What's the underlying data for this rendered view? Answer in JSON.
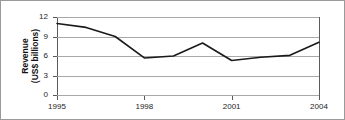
{
  "chart_data": {
    "type": "line",
    "title": "",
    "xlabel": "",
    "ylabel": "Revenue (US$ billions)",
    "ylabel_lines": [
      "Revenue",
      "(US$ billions)"
    ],
    "x": [
      1995,
      1996,
      1997,
      1998,
      1999,
      2000,
      2001,
      2002,
      2003,
      2004
    ],
    "values": [
      11.0,
      10.4,
      9.0,
      5.7,
      6.0,
      8.0,
      5.3,
      5.8,
      6.1,
      8.1
    ],
    "series": [
      {
        "name": "Revenue",
        "values": [
          11.0,
          10.4,
          9.0,
          5.7,
          6.0,
          8.0,
          5.3,
          5.8,
          6.1,
          8.1
        ]
      }
    ],
    "xlim": [
      1995,
      2004
    ],
    "ylim": [
      0,
      12
    ],
    "yticks": [
      0,
      3,
      6,
      9,
      12
    ],
    "ytick_labels": [
      "0",
      "3",
      "6",
      "9",
      "12"
    ],
    "xticks": [
      1995,
      1998,
      2001,
      2004
    ],
    "xtick_labels": [
      "1995",
      "1998",
      "2001",
      "2004"
    ],
    "grid": "horizontal",
    "legend": "none",
    "line_color": "#1a1a1a",
    "grid_color": "#a8a8a8",
    "axis_color": "#5a5a5a",
    "background": "#ffffff"
  }
}
